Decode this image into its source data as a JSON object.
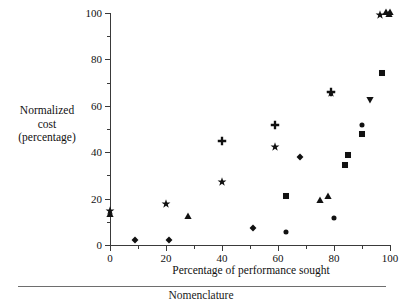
{
  "figure": {
    "footer_caption": "Nomenclature"
  },
  "chart_data": {
    "type": "scatter",
    "title": "",
    "xlabel": "Percentage of performance sought",
    "ylabel": "Normalized cost (percentage)",
    "ylabel_lines": [
      "Normalized",
      "cost",
      "(percentage)"
    ],
    "xlim": [
      0,
      100
    ],
    "ylim": [
      0,
      100
    ],
    "xticks": [
      0,
      20,
      40,
      60,
      80,
      100
    ],
    "yticks": [
      0,
      20,
      40,
      60,
      80,
      100
    ],
    "xticklabels": [
      "0",
      "20",
      "40",
      "60",
      "80",
      "100"
    ],
    "yticklabels": [
      "0",
      "20",
      "40",
      "60",
      "80",
      "100"
    ],
    "x_minor_ticks": [
      10,
      30,
      50,
      70,
      90
    ],
    "y_minor_ticks": [
      10,
      30,
      50,
      70,
      90
    ],
    "grid": false,
    "legend": "none",
    "marker_color": "#111111",
    "points": [
      {
        "x": 0,
        "y": 14.5,
        "marker": "star"
      },
      {
        "x": 0,
        "y": 13.5,
        "marker": "triangle-up"
      },
      {
        "x": 9,
        "y": 2.3,
        "marker": "diamond"
      },
      {
        "x": 20,
        "y": 17.5,
        "marker": "star"
      },
      {
        "x": 21,
        "y": 2.3,
        "marker": "diamond"
      },
      {
        "x": 28,
        "y": 12.6,
        "marker": "triangle-up"
      },
      {
        "x": 40,
        "y": 45.0,
        "marker": "plus"
      },
      {
        "x": 40,
        "y": 27.2,
        "marker": "star"
      },
      {
        "x": 51,
        "y": 7.4,
        "marker": "diamond"
      },
      {
        "x": 59,
        "y": 51.8,
        "marker": "plus"
      },
      {
        "x": 59,
        "y": 42.2,
        "marker": "star"
      },
      {
        "x": 63,
        "y": 21.2,
        "marker": "square"
      },
      {
        "x": 63,
        "y": 5.8,
        "marker": "circle"
      },
      {
        "x": 68,
        "y": 38.0,
        "marker": "diamond"
      },
      {
        "x": 75,
        "y": 19.4,
        "marker": "triangle-up"
      },
      {
        "x": 78,
        "y": 21.0,
        "marker": "triangle-up"
      },
      {
        "x": 79,
        "y": 65.4,
        "marker": "star"
      },
      {
        "x": 79,
        "y": 66.0,
        "marker": "plus"
      },
      {
        "x": 80,
        "y": 11.5,
        "marker": "circle"
      },
      {
        "x": 84,
        "y": 34.4,
        "marker": "square"
      },
      {
        "x": 85,
        "y": 38.8,
        "marker": "square"
      },
      {
        "x": 90,
        "y": 51.6,
        "marker": "circle"
      },
      {
        "x": 90,
        "y": 48.0,
        "marker": "square"
      },
      {
        "x": 93,
        "y": 62.6,
        "marker": "triangle-down"
      },
      {
        "x": 97,
        "y": 74.0,
        "marker": "square"
      },
      {
        "x": 96.5,
        "y": 99.0,
        "marker": "star"
      },
      {
        "x": 98.5,
        "y": 100.5,
        "marker": "triangle-up"
      },
      {
        "x": 99.5,
        "y": 99.5,
        "marker": "triangle-up"
      },
      {
        "x": 100,
        "y": 100.5,
        "marker": "triangle-up"
      }
    ]
  }
}
